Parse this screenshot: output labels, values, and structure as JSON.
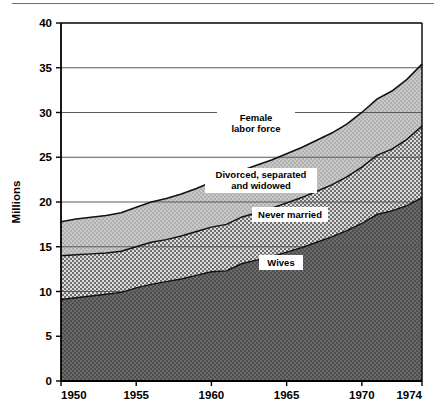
{
  "chart_data": {
    "type": "area",
    "title": "",
    "subtitle": "",
    "xlabel": "",
    "ylabel": "Millions",
    "xlim": [
      1950,
      1974
    ],
    "ylim": [
      0,
      40
    ],
    "grid": true,
    "stacked": true,
    "legend_position": "inline-annotations",
    "x_tick_labels": [
      "1950",
      "1955",
      "1960",
      "1965",
      "1970",
      "1974"
    ],
    "x_ticks": [
      1950,
      1955,
      1960,
      1965,
      1970,
      1974
    ],
    "y_tick_labels": [
      "0",
      "5",
      "10",
      "15",
      "20",
      "25",
      "30",
      "35",
      "40"
    ],
    "y_ticks": [
      0,
      5,
      10,
      15,
      20,
      25,
      30,
      35,
      40
    ],
    "x": [
      1950,
      1951,
      1952,
      1953,
      1954,
      1955,
      1956,
      1957,
      1958,
      1959,
      1960,
      1961,
      1962,
      1963,
      1964,
      1965,
      1966,
      1967,
      1968,
      1969,
      1970,
      1971,
      1972,
      1973,
      1974
    ],
    "series": [
      {
        "name": "Wives",
        "label": "Wives",
        "color": "#575757",
        "pattern": "dense-checker",
        "values": [
          9.1,
          9.3,
          9.5,
          9.7,
          9.9,
          10.4,
          10.8,
          11.1,
          11.4,
          11.8,
          12.2,
          12.3,
          13.1,
          13.5,
          13.9,
          14.4,
          14.9,
          15.5,
          16.1,
          16.8,
          17.6,
          18.6,
          19.0,
          19.6,
          20.5
        ]
      },
      {
        "name": "Never married",
        "label": "Never married",
        "color": "#9a9a9a",
        "pattern": "medium-checker",
        "values": [
          4.9,
          4.8,
          4.7,
          4.6,
          4.6,
          4.6,
          4.7,
          4.7,
          4.8,
          4.9,
          5.0,
          5.2,
          5.2,
          5.3,
          5.4,
          5.5,
          5.6,
          5.7,
          5.8,
          6.0,
          6.3,
          6.6,
          6.9,
          7.4,
          8.0
        ]
      },
      {
        "name": "Divorced, separated and widowed",
        "label": "Divorced, separated\nand widowed",
        "label_line1": "Divorced, separated",
        "label_line2": "and widowed",
        "color": "#b8b8b8",
        "pattern": "light-checker",
        "values": [
          3.8,
          4.0,
          4.1,
          4.2,
          4.3,
          4.4,
          4.5,
          4.6,
          4.7,
          4.8,
          5.0,
          5.1,
          5.2,
          5.3,
          5.4,
          5.5,
          5.6,
          5.7,
          5.8,
          5.9,
          6.1,
          6.3,
          6.5,
          6.7,
          6.9
        ]
      }
    ],
    "total_label": "Female labor force",
    "total_label_line1": "Female",
    "total_label_line2": "labor force",
    "totals": [
      17.8,
      18.1,
      18.3,
      18.5,
      18.8,
      19.4,
      20.0,
      20.4,
      20.9,
      21.5,
      22.2,
      22.6,
      23.5,
      24.1,
      24.7,
      25.4,
      26.1,
      26.9,
      27.7,
      28.7,
      30.0,
      31.5,
      32.4,
      33.7,
      35.4
    ],
    "annotations": [
      {
        "text": "Female labor force",
        "x": 1963,
        "y": 29.0
      },
      {
        "text": "Divorced, separated and widowed",
        "x": 1962,
        "y": 22.3
      },
      {
        "text": "Never married",
        "x": 1966,
        "y": 18.6
      },
      {
        "text": "Wives",
        "x": 1966,
        "y": 13.6
      }
    ]
  },
  "axes": {
    "y_title": "Millions",
    "y_ticks": [
      "40",
      "35",
      "30",
      "25",
      "20",
      "15",
      "10",
      "5",
      "0"
    ],
    "x_ticks": [
      "1950",
      "1955",
      "1960",
      "1965",
      "1970",
      "1974"
    ]
  },
  "labels": {
    "female_labor_force_line1": "Female",
    "female_labor_force_line2": "labor force",
    "divorced_line1": "Divorced, separated",
    "divorced_line2": "and widowed",
    "never_married": "Never married",
    "wives": "Wives"
  },
  "colors": {
    "wives": "#575757",
    "never_married": "#9a9a9a",
    "divorced": "#b8b8b8",
    "axis": "#000000",
    "gridline": "#5a5a5a",
    "background": "#ffffff"
  }
}
